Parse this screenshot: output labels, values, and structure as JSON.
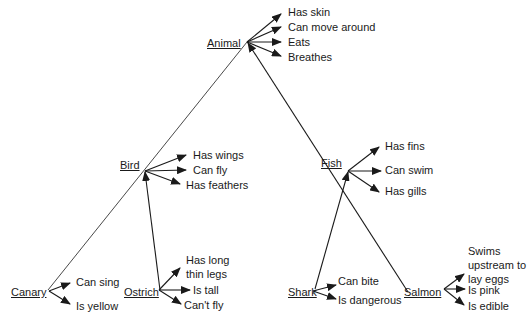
{
  "diagram": {
    "type": "semantic-network",
    "nodes": {
      "animal": {
        "label": "Animal",
        "properties": [
          "Has skin",
          "Can move around",
          "Eats",
          "Breathes"
        ]
      },
      "bird": {
        "label": "Bird",
        "properties": [
          "Has wings",
          "Can fly",
          "Has feathers"
        ]
      },
      "fish": {
        "label": "Fish",
        "properties": [
          "Has fins",
          "Can swim",
          "Has gills"
        ]
      },
      "canary": {
        "label": "Canary",
        "properties": [
          "Can sing",
          "Is yellow"
        ]
      },
      "ostrich": {
        "label": "Ostrich",
        "properties": [
          "Has long\nthin legs",
          "Is tall",
          "Can't fly"
        ]
      },
      "shark": {
        "label": "Shark",
        "properties": [
          "Can bite",
          "Is dangerous"
        ]
      },
      "salmon": {
        "label": "Salmon",
        "properties": [
          "Swims\nupstream to\nlay eggs",
          "Is pink",
          "Is edible"
        ]
      }
    },
    "edges": [
      {
        "from": "Bird",
        "to": "Animal"
      },
      {
        "from": "Fish",
        "to": "Animal"
      },
      {
        "from": "Canary",
        "to": "Bird"
      },
      {
        "from": "Ostrich",
        "to": "Bird"
      },
      {
        "from": "Shark",
        "to": "Fish"
      },
      {
        "from": "Salmon",
        "to": "Fish"
      }
    ],
    "colors": {
      "line": "#1a1a1a",
      "text": "#1a1a1a",
      "background": "#ffffff"
    }
  }
}
